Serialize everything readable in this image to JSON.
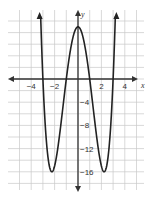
{
  "chart_data": {
    "type": "line",
    "title": "",
    "xlabel": "x",
    "ylabel": "y",
    "xlim": [
      -5.5,
      5.5
    ],
    "ylim": [
      -20,
      12
    ],
    "x_ticks": [
      -4,
      -2,
      2,
      4
    ],
    "y_ticks": [
      -4,
      -8,
      -12,
      -16
    ],
    "x_tick_labels": [
      "−4",
      "−2",
      "2",
      "4"
    ],
    "y_tick_labels": [
      "−4",
      "−8",
      "−12",
      "−16"
    ],
    "grid": true,
    "grid_x_step": 1,
    "grid_y_step": 2,
    "series": [
      {
        "name": "curve",
        "description": "quartic with x-intercepts at -3, -1, 1, 3; local max (0, 9); minima near (-2.24, -16) and (2.24, -16)",
        "points": [
          [
            -3.3,
            26.0
          ],
          [
            -3,
            0
          ],
          [
            -2.24,
            -16
          ],
          [
            -1,
            0
          ],
          [
            0,
            9
          ],
          [
            1,
            0
          ],
          [
            2.24,
            -16
          ],
          [
            3,
            0
          ],
          [
            3.3,
            26.0
          ]
        ]
      }
    ],
    "key_points": {
      "x_intercepts": [
        -3,
        -1,
        1,
        3
      ],
      "y_intercept": 9,
      "minima": [
        [
          -2.24,
          -16
        ],
        [
          2.24,
          -16
        ]
      ],
      "local_max": [
        0,
        9
      ]
    }
  },
  "colors": {
    "grid": "#c8c8c8",
    "axis": "#333333",
    "curve": "#222222"
  }
}
